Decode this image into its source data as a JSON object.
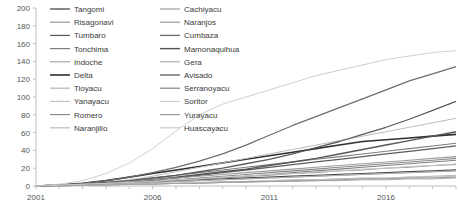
{
  "chart_data": {
    "type": "line",
    "title": "",
    "xlabel": "",
    "ylabel": "",
    "xlim": [
      2001,
      2019
    ],
    "ylim": [
      0,
      200
    ],
    "ytick_step": 20,
    "yticks": [
      0,
      20,
      40,
      60,
      80,
      100,
      120,
      140,
      160,
      180,
      200
    ],
    "xticks_major": [
      2001,
      2006,
      2011,
      2016
    ],
    "xticks_minor_every": 1,
    "grid": false,
    "legend_position": "top-left-inside",
    "legend_columns": 2,
    "x": [
      2001,
      2002,
      2003,
      2004,
      2005,
      2006,
      2007,
      2008,
      2009,
      2010,
      2011,
      2012,
      2013,
      2014,
      2015,
      2016,
      2017,
      2018,
      2019
    ],
    "series": [
      {
        "name": "Tangomi",
        "color": "#4a4a4a",
        "width": 1.3,
        "values": [
          0,
          1,
          2,
          3,
          4,
          5,
          6,
          7,
          8,
          9,
          10,
          11,
          12,
          13,
          14,
          15,
          16,
          17,
          18
        ]
      },
      {
        "name": "Risagonavi",
        "color": "#9a9a9a",
        "width": 1.0,
        "values": [
          0,
          1,
          1,
          2,
          3,
          4,
          5,
          6,
          7,
          8,
          9,
          10,
          11,
          12,
          13,
          14,
          15,
          16,
          17
        ]
      },
      {
        "name": "Tumbaro",
        "color": "#5c5c5c",
        "width": 1.3,
        "values": [
          0,
          1,
          2,
          3,
          5,
          7,
          9,
          12,
          15,
          18,
          21,
          24,
          27,
          30,
          33,
          36,
          39,
          42,
          45
        ]
      },
      {
        "name": "Tonchima",
        "color": "#7d7d7d",
        "width": 1.1,
        "values": [
          0,
          1,
          2,
          4,
          6,
          9,
          12,
          15,
          18,
          21,
          24,
          27,
          30,
          33,
          36,
          39,
          42,
          45,
          48
        ]
      },
      {
        "name": "Indoche",
        "color": "#aaaaaa",
        "width": 1.0,
        "values": [
          0,
          0,
          1,
          1,
          2,
          2,
          3,
          3,
          4,
          4,
          5,
          5,
          6,
          6,
          7,
          7,
          8,
          8,
          9
        ]
      },
      {
        "name": "Delta",
        "color": "#2f2f2f",
        "width": 1.6,
        "values": [
          0,
          1,
          3,
          6,
          10,
          14,
          18,
          22,
          26,
          30,
          34,
          38,
          42,
          46,
          50,
          52,
          54,
          56,
          58
        ]
      },
      {
        "name": "Tioyacu",
        "color": "#b5b5b5",
        "width": 1.0,
        "values": [
          0,
          0,
          1,
          1,
          2,
          3,
          3,
          4,
          5,
          5,
          6,
          7,
          7,
          8,
          9,
          9,
          10,
          11,
          12
        ]
      },
      {
        "name": "Yanayacu",
        "color": "#c2c2c2",
        "width": 1.0,
        "values": [
          0,
          0,
          1,
          1,
          2,
          2,
          3,
          4,
          4,
          5,
          6,
          6,
          7,
          8,
          8,
          9,
          10,
          10,
          11
        ]
      },
      {
        "name": "Romero",
        "color": "#8a8a8a",
        "width": 1.1,
        "values": [
          0,
          1,
          2,
          3,
          4,
          6,
          7,
          9,
          11,
          13,
          15,
          17,
          19,
          21,
          23,
          25,
          27,
          29,
          31
        ]
      },
      {
        "name": "Naranjillo",
        "color": "#bdbdbd",
        "width": 1.0,
        "values": [
          0,
          1,
          2,
          4,
          7,
          11,
          16,
          21,
          26,
          31,
          36,
          41,
          46,
          51,
          56,
          61,
          66,
          71,
          76
        ]
      },
      {
        "name": "Cachiyacu",
        "color": "#9e9e9e",
        "width": 1.0,
        "values": [
          0,
          0,
          1,
          1,
          2,
          2,
          3,
          3,
          4,
          5,
          5,
          6,
          6,
          7,
          8,
          8,
          9,
          9,
          10
        ]
      },
      {
        "name": "Naranjos",
        "color": "#989898",
        "width": 1.0,
        "values": [
          0,
          1,
          2,
          3,
          4,
          5,
          6,
          8,
          9,
          11,
          12,
          14,
          15,
          17,
          18,
          20,
          21,
          23,
          24
        ]
      },
      {
        "name": "Cumbaza",
        "color": "#6e6e6e",
        "width": 1.3,
        "values": [
          0,
          1,
          3,
          6,
          10,
          15,
          21,
          28,
          36,
          46,
          57,
          68,
          78,
          88,
          98,
          108,
          118,
          126,
          134
        ]
      },
      {
        "name": "Mamonaquihua",
        "color": "#565656",
        "width": 1.4,
        "values": [
          0,
          1,
          2,
          3,
          5,
          7,
          10,
          13,
          16,
          19,
          23,
          27,
          31,
          36,
          41,
          46,
          51,
          56,
          61
        ]
      },
      {
        "name": "Gera",
        "color": "#b0b0b0",
        "width": 1.0,
        "values": [
          0,
          0,
          1,
          2,
          3,
          4,
          5,
          6,
          7,
          8,
          9,
          10,
          11,
          12,
          13,
          14,
          15,
          16,
          17
        ]
      },
      {
        "name": "Avisado",
        "color": "#5a5a5a",
        "width": 1.3,
        "values": [
          0,
          1,
          2,
          4,
          6,
          9,
          12,
          16,
          20,
          25,
          30,
          36,
          43,
          50,
          58,
          66,
          75,
          85,
          95
        ]
      },
      {
        "name": "Serranoyacu",
        "color": "#828282",
        "width": 1.1,
        "values": [
          0,
          1,
          2,
          3,
          4,
          5,
          6,
          8,
          9,
          11,
          13,
          15,
          17,
          19,
          21,
          23,
          25,
          27,
          29
        ]
      },
      {
        "name": "Soritor",
        "color": "#cfcfcf",
        "width": 1.0,
        "values": [
          0,
          2,
          6,
          14,
          26,
          42,
          62,
          80,
          92,
          100,
          108,
          116,
          124,
          130,
          136,
          142,
          146,
          150,
          152
        ]
      },
      {
        "name": "Yurayacu",
        "color": "#9c9c9c",
        "width": 1.1,
        "values": [
          0,
          1,
          2,
          3,
          5,
          7,
          9,
          11,
          13,
          15,
          17,
          19,
          21,
          23,
          25,
          27,
          29,
          31,
          33
        ]
      },
      {
        "name": "Huascayacu",
        "color": "#c8c8c8",
        "width": 1.0,
        "values": [
          0,
          1,
          2,
          3,
          4,
          5,
          7,
          8,
          10,
          11,
          13,
          14,
          16,
          17,
          19,
          20,
          22,
          23,
          25
        ]
      }
    ]
  },
  "axis": {
    "y_labels": [
      "200",
      "180",
      "160",
      "140",
      "120",
      "100",
      "80",
      "60",
      "40",
      "20",
      "0"
    ],
    "x_labels": [
      "2001",
      "2006",
      "2011",
      "2016"
    ]
  },
  "legend": {
    "column1": [
      {
        "label": "Tangomi"
      },
      {
        "label": "Risagonavi"
      },
      {
        "label": "Tumbaro"
      },
      {
        "label": "Tonchima"
      },
      {
        "label": "Indoche"
      },
      {
        "label": "Delta"
      },
      {
        "label": "Tioyacu"
      },
      {
        "label": "Yanayacu"
      },
      {
        "label": "Romero"
      },
      {
        "label": "Naranjillo"
      }
    ],
    "column2": [
      {
        "label": "Cachiyacu"
      },
      {
        "label": "Naranjos"
      },
      {
        "label": "Cumbaza"
      },
      {
        "label": "Mamonaquihua"
      },
      {
        "label": "Gera"
      },
      {
        "label": "Avisado"
      },
      {
        "label": "Serranoyacu"
      },
      {
        "label": "Soritor"
      },
      {
        "label": "Yurayacu"
      },
      {
        "label": "Huascayacu"
      }
    ]
  }
}
